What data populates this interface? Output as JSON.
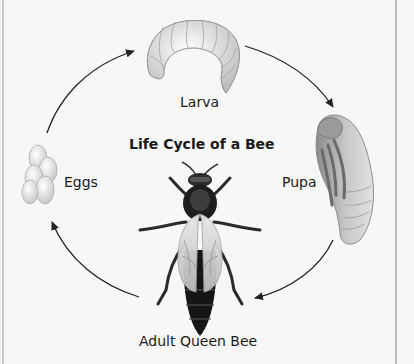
{
  "diagram": {
    "title": "Life Cycle of a Bee",
    "stages": [
      {
        "id": "eggs",
        "label": "Eggs"
      },
      {
        "id": "larva",
        "label": "Larva"
      },
      {
        "id": "pupa",
        "label": "Pupa"
      },
      {
        "id": "adult",
        "label": "Adult Queen Bee"
      }
    ],
    "arrows": [
      {
        "from": "Eggs",
        "to": "Larva"
      },
      {
        "from": "Larva",
        "to": "Pupa"
      },
      {
        "from": "Pupa",
        "to": "Adult Queen Bee"
      },
      {
        "from": "Adult Queen Bee",
        "to": "Eggs"
      }
    ]
  }
}
